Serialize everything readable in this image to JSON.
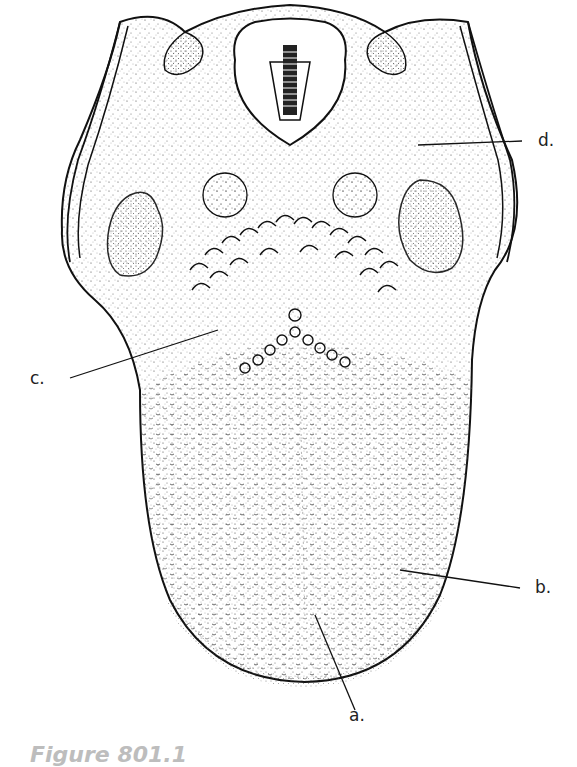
{
  "figure": {
    "caption": "Figure 801.1",
    "labels": {
      "a": "a.",
      "b": "b.",
      "c": "c.",
      "d": "d."
    },
    "colors": {
      "ink": "#111111",
      "stipple": "#333333",
      "caption": "#bdbdbd",
      "background": "#ffffff"
    }
  }
}
